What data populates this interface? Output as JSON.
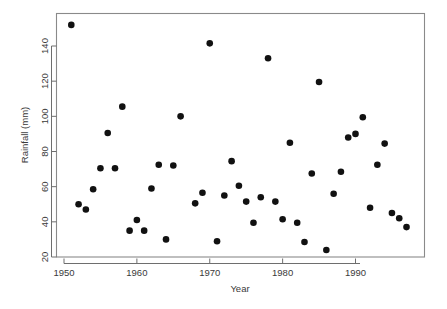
{
  "chart_data": {
    "type": "scatter",
    "title": "",
    "xlabel": "Year",
    "ylabel": "Rainfall (mm)",
    "xlim": [
      1949.5,
      1998.5
    ],
    "ylim": [
      18,
      155
    ],
    "xticks": [
      1950,
      1960,
      1970,
      1980,
      1990
    ],
    "xticklabels": [
      "1950",
      "1960",
      "1970",
      "1980",
      "1990"
    ],
    "yticks": [
      20,
      40,
      60,
      80,
      100,
      120,
      140
    ],
    "yticklabels": [
      "20",
      "40",
      "60",
      "80",
      "100",
      "120",
      "140"
    ],
    "grid": false,
    "legend": null,
    "marker": "filled-circle",
    "marker_color": "#111111",
    "marker_size": 3.3,
    "x": [
      1951,
      1952,
      1953,
      1954,
      1955,
      1956,
      1957,
      1958,
      1959,
      1960,
      1961,
      1962,
      1963,
      1964,
      1965,
      1966,
      1968,
      1969,
      1970,
      1971,
      1972,
      1973,
      1974,
      1975,
      1976,
      1977,
      1978,
      1979,
      1980,
      1981,
      1982,
      1983,
      1984,
      1985,
      1986,
      1987,
      1988,
      1989,
      1990,
      1991,
      1992,
      1993,
      1994,
      1995,
      1996,
      1997
    ],
    "y": [
      152,
      50,
      47,
      58.5,
      70.5,
      90.5,
      70.5,
      105.5,
      35,
      41,
      35,
      59,
      72.5,
      30,
      72,
      100,
      50.5,
      56.5,
      141.5,
      29,
      55,
      74.5,
      60.5,
      51.5,
      39.5,
      54,
      133,
      51.5,
      41.5,
      85,
      39.5,
      28.5,
      67.5,
      119.5,
      24,
      56,
      68.5,
      88,
      90,
      99.5,
      48,
      72.5,
      84.5,
      45,
      42,
      37
    ],
    "points": [
      {
        "year": 1951,
        "rainfall": 152
      },
      {
        "year": 1952,
        "rainfall": 50
      },
      {
        "year": 1953,
        "rainfall": 47
      },
      {
        "year": 1954,
        "rainfall": 58.5
      },
      {
        "year": 1955,
        "rainfall": 70.5
      },
      {
        "year": 1956,
        "rainfall": 90.5
      },
      {
        "year": 1957,
        "rainfall": 70.5
      },
      {
        "year": 1958,
        "rainfall": 105.5
      },
      {
        "year": 1959,
        "rainfall": 35
      },
      {
        "year": 1960,
        "rainfall": 41
      },
      {
        "year": 1961,
        "rainfall": 35
      },
      {
        "year": 1962,
        "rainfall": 59
      },
      {
        "year": 1963,
        "rainfall": 72.5
      },
      {
        "year": 1964,
        "rainfall": 30
      },
      {
        "year": 1965,
        "rainfall": 72
      },
      {
        "year": 1966,
        "rainfall": 100
      },
      {
        "year": 1968,
        "rainfall": 50.5
      },
      {
        "year": 1969,
        "rainfall": 56.5
      },
      {
        "year": 1970,
        "rainfall": 141.5
      },
      {
        "year": 1971,
        "rainfall": 29
      },
      {
        "year": 1972,
        "rainfall": 55
      },
      {
        "year": 1973,
        "rainfall": 74.5
      },
      {
        "year": 1974,
        "rainfall": 60.5
      },
      {
        "year": 1975,
        "rainfall": 51.5
      },
      {
        "year": 1976,
        "rainfall": 39.5
      },
      {
        "year": 1977,
        "rainfall": 54
      },
      {
        "year": 1978,
        "rainfall": 133
      },
      {
        "year": 1979,
        "rainfall": 51.5
      },
      {
        "year": 1980,
        "rainfall": 41.5
      },
      {
        "year": 1981,
        "rainfall": 85
      },
      {
        "year": 1982,
        "rainfall": 39.5
      },
      {
        "year": 1983,
        "rainfall": 28.5
      },
      {
        "year": 1984,
        "rainfall": 67.5
      },
      {
        "year": 1985,
        "rainfall": 119.5
      },
      {
        "year": 1986,
        "rainfall": 24
      },
      {
        "year": 1987,
        "rainfall": 56
      },
      {
        "year": 1988,
        "rainfall": 68.5
      },
      {
        "year": 1989,
        "rainfall": 88
      },
      {
        "year": 1990,
        "rainfall": 90
      },
      {
        "year": 1991,
        "rainfall": 99.5
      },
      {
        "year": 1992,
        "rainfall": 48
      },
      {
        "year": 1993,
        "rainfall": 72.5
      },
      {
        "year": 1994,
        "rainfall": 84.5
      },
      {
        "year": 1995,
        "rainfall": 45
      },
      {
        "year": 1996,
        "rainfall": 42
      },
      {
        "year": 1997,
        "rainfall": 37
      }
    ]
  }
}
